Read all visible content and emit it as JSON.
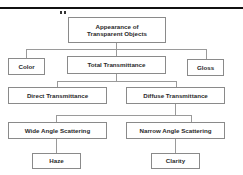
{
  "diagram": {
    "root": "Appearance of Transparent Objects",
    "root_lines": [
      "Appearance of",
      "Transparent Objects"
    ],
    "level1": [
      "Color",
      "Total Transmittance",
      "Gloss"
    ],
    "level2": [
      "Direct Transmittance",
      "Diffuse Transmittance"
    ],
    "level3": [
      "Wide Angle Scattering",
      "Narrow Angle Scattering"
    ],
    "level4": [
      "Haze",
      "Clarity"
    ]
  },
  "colors": {
    "box_border": "#8a8a8a",
    "connector": "#9a9a9a",
    "text": "#2a2a2a",
    "rule": "#111111"
  }
}
